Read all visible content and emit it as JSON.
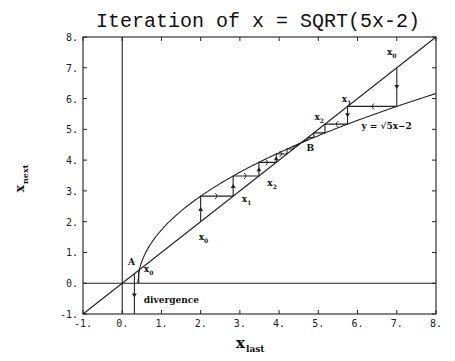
{
  "chart_data": {
    "type": "line",
    "title": "Iteration of x = SQRT(5x-2)",
    "xlabel": "x_last",
    "ylabel": "x_next",
    "xlim": [
      -1,
      8
    ],
    "ylim": [
      -1,
      8
    ],
    "x_ticks": [
      "-1.",
      "0.",
      "1.",
      "2.",
      "3.",
      "4.",
      "5.",
      "6.",
      "7.",
      "8."
    ],
    "y_ticks": [
      "-1.",
      "0.",
      "1.",
      "2.",
      "3.",
      "4.",
      "5.",
      "6.",
      "7.",
      "8."
    ],
    "grid": false,
    "series": [
      {
        "name": "y = x",
        "x": [
          -1,
          8
        ],
        "y": [
          -1,
          8
        ]
      },
      {
        "name": "y = √(5x−2)",
        "x_start": 0.4,
        "x_end": 8
      },
      {
        "name": "cobweb from x0=7",
        "x0": 7,
        "converges_to": 4.562
      },
      {
        "name": "cobweb from x0=2",
        "x0": 2,
        "converges_to": 4.562
      },
      {
        "name": "divergence from x0≈0.33",
        "x0": 0.33
      }
    ],
    "annotations": [
      {
        "text": "A",
        "x": 0.44,
        "y": 0.44
      },
      {
        "text": "B",
        "x": 4.56,
        "y": 4.56
      },
      {
        "text": "y = √5x−2",
        "x": 5.9,
        "y": 5.1
      },
      {
        "text": "divergence",
        "x": 0.55,
        "y": -0.5
      },
      {
        "text": "x0",
        "x": 7.0,
        "y": 7.4
      },
      {
        "text": "x1",
        "x": 5.8,
        "y": 5.9
      },
      {
        "text": "x2",
        "x": 5.1,
        "y": 5.3
      },
      {
        "text": "x0",
        "x": 2.0,
        "y": 1.9
      },
      {
        "text": "x1",
        "x": 2.9,
        "y": 2.6
      },
      {
        "text": "x2",
        "x": 3.6,
        "y": 3.2
      },
      {
        "text": "x0",
        "x": 0.5,
        "y": 0.35
      }
    ]
  },
  "labels": {
    "title": "Iteration of x = SQRT(5x-2)",
    "xlabel_main": "x",
    "xlabel_sub": "last",
    "ylabel_main": "x",
    "ylabel_sub": "next",
    "curve_label": "y = √5x−2",
    "divergence": "divergence",
    "A": "A",
    "B": "B",
    "x0": "x",
    "sub0": "0",
    "sub1": "1",
    "sub2": "2"
  }
}
